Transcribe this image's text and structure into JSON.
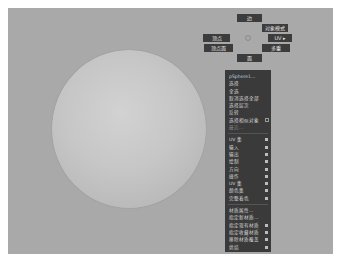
{
  "viewport": {
    "background_color": "#a9a9a9",
    "object": "sphere"
  },
  "marking_menu": {
    "north": "边",
    "north_east": "对象模式",
    "west": "顶点",
    "east": "UV ▸",
    "south_west": "顶点面",
    "south_east": "多重",
    "south": "面"
  },
  "context_menu": {
    "header": "pSphere1...",
    "items": [
      {
        "label": "选择",
        "type": "item"
      },
      {
        "label": "全选",
        "type": "item"
      },
      {
        "label": "取消选择全部",
        "type": "item"
      },
      {
        "label": "选择层次",
        "type": "item"
      },
      {
        "label": "反转",
        "type": "item"
      },
      {
        "label": "选择相似对象",
        "type": "option"
      },
      {
        "label": "最近...",
        "type": "disabled"
      },
      {
        "label": "UV 集",
        "type": "submenu"
      },
      {
        "label": "输入",
        "type": "submenu"
      },
      {
        "label": "输出",
        "type": "submenu"
      },
      {
        "label": "绘制",
        "type": "submenu"
      },
      {
        "label": "方向",
        "type": "submenu"
      },
      {
        "label": "操作",
        "type": "submenu"
      },
      {
        "label": "UV 集",
        "type": "submenu"
      },
      {
        "label": "颜色集",
        "type": "submenu"
      },
      {
        "label": "完整着色",
        "type": "submenu"
      },
      {
        "label": "材质属性...",
        "type": "item"
      },
      {
        "label": "指定新材质...",
        "type": "item"
      },
      {
        "label": "指定现有材质",
        "type": "submenu"
      },
      {
        "label": "指定收藏材质",
        "type": "submenu"
      },
      {
        "label": "移除材质覆盖",
        "type": "submenu"
      },
      {
        "label": "烘焙",
        "type": "submenu"
      }
    ]
  },
  "colors": {
    "menu_bg": "#3a3a3a",
    "menu_text": "#d8d8d8",
    "header_text": "#b9cfe6",
    "sphere": "#c6c6c6"
  }
}
